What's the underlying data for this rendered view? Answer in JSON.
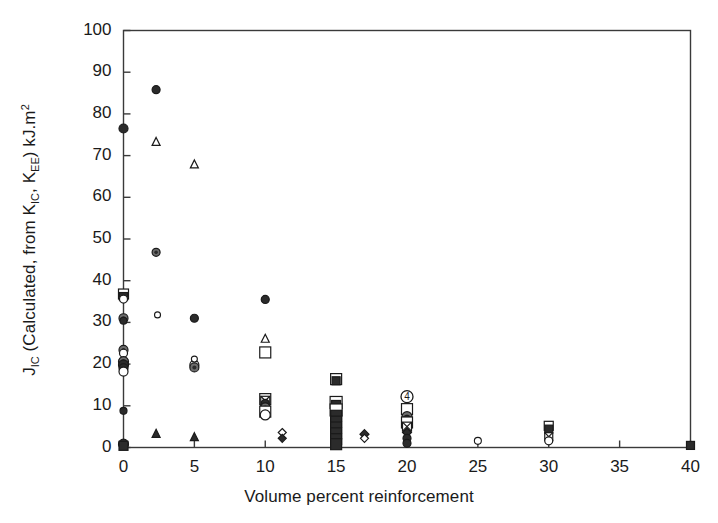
{
  "chart_data": {
    "type": "scatter",
    "title": "",
    "xlabel": "Volume percent reinforcement",
    "ylabel_parts": {
      "j": "J",
      "j_sub": "IC",
      "mid": " (Calculated, from K",
      "k1_sub": "IC",
      "mid2": ", K",
      "k2_sub": "EE",
      "tail": ") kJ.m",
      "tail_sup": "2"
    },
    "ylabel": "JIC (Calculated, from KIC, KEE) kJ.m2",
    "xlim": [
      0,
      40
    ],
    "ylim": [
      0,
      100
    ],
    "xticks": [
      0,
      5,
      10,
      15,
      20,
      25,
      30,
      35,
      40
    ],
    "yticks": [
      0,
      10,
      20,
      30,
      40,
      50,
      60,
      70,
      80,
      90,
      100
    ],
    "xtick_labels": [
      "0",
      "5",
      "10",
      "15",
      "20",
      "25",
      "30",
      "35",
      "40"
    ],
    "ytick_labels": [
      "0",
      "10",
      "20",
      "30",
      "40",
      "50",
      "60",
      "70",
      "80",
      "90",
      "100"
    ],
    "grid": false,
    "legend": "none",
    "frame": "full-box",
    "tick_direction": "in",
    "marker_colors": {
      "stroke": "#1a1a1a",
      "fill_solid": "#2b2b2b",
      "fill_open": "#ffffff",
      "fill_half": "#6d6d6d"
    },
    "points": [
      {
        "x": 0,
        "y": 76.5,
        "marker": "filled-circle",
        "size": 9
      },
      {
        "x": 2.3,
        "y": 85.8,
        "marker": "filled-circle",
        "size": 8
      },
      {
        "x": 2.3,
        "y": 73.4,
        "marker": "open-triangle",
        "size": 8
      },
      {
        "x": 5.0,
        "y": 68.0,
        "marker": "open-triangle",
        "size": 8
      },
      {
        "x": 2.3,
        "y": 46.8,
        "marker": "half-circle",
        "size": 8
      },
      {
        "x": 0,
        "y": 36.8,
        "marker": "open-square",
        "size": 10
      },
      {
        "x": 0,
        "y": 36.2,
        "marker": "filled-square",
        "size": 8
      },
      {
        "x": 0,
        "y": 35.6,
        "marker": "open-circle",
        "size": 8
      },
      {
        "x": 2.4,
        "y": 31.8,
        "marker": "small-open-circle",
        "size": 6
      },
      {
        "x": 5.0,
        "y": 31.0,
        "marker": "filled-circle",
        "size": 8
      },
      {
        "x": 0,
        "y": 31.0,
        "marker": "half-circle",
        "size": 9
      },
      {
        "x": 0,
        "y": 30.4,
        "marker": "filled-circle",
        "size": 7
      },
      {
        "x": 10.0,
        "y": 35.5,
        "marker": "filled-circle",
        "size": 8
      },
      {
        "x": 0,
        "y": 23.4,
        "marker": "half-circle",
        "size": 9
      },
      {
        "x": 0,
        "y": 22.6,
        "marker": "open-circle",
        "size": 8
      },
      {
        "x": 10.0,
        "y": 26.2,
        "marker": "open-triangle",
        "size": 8
      },
      {
        "x": 10.0,
        "y": 22.8,
        "marker": "open-square",
        "size": 11
      },
      {
        "x": 0,
        "y": 20.6,
        "marker": "half-circle",
        "size": 10
      },
      {
        "x": 0,
        "y": 19.8,
        "marker": "filled-circle",
        "size": 10
      },
      {
        "x": 0,
        "y": 19.0,
        "marker": "filled-circle",
        "size": 9
      },
      {
        "x": 0,
        "y": 18.2,
        "marker": "open-circle",
        "size": 9
      },
      {
        "x": 5.0,
        "y": 19.8,
        "marker": "open-circle",
        "size": 9
      },
      {
        "x": 5.0,
        "y": 19.2,
        "marker": "half-circle",
        "size": 9
      },
      {
        "x": 5.0,
        "y": 21.2,
        "marker": "small-open-circle",
        "size": 6
      },
      {
        "x": 15.0,
        "y": 16.4,
        "marker": "open-square",
        "size": 11
      },
      {
        "x": 15.0,
        "y": 16.0,
        "marker": "filled-square",
        "size": 8
      },
      {
        "x": 20.0,
        "y": 12.2,
        "marker": "circled-four",
        "size": 12
      },
      {
        "x": 10.0,
        "y": 11.6,
        "marker": "open-square",
        "size": 11
      },
      {
        "x": 10.0,
        "y": 11.2,
        "marker": "cross-square",
        "size": 9
      },
      {
        "x": 10.0,
        "y": 10.6,
        "marker": "filled-circle",
        "size": 8
      },
      {
        "x": 10.0,
        "y": 9.6,
        "marker": "half-circle",
        "size": 9
      },
      {
        "x": 10.0,
        "y": 8.6,
        "marker": "open-square",
        "size": 11
      },
      {
        "x": 10.0,
        "y": 7.8,
        "marker": "open-circle",
        "size": 10
      },
      {
        "x": 15.0,
        "y": 10.8,
        "marker": "open-square",
        "size": 12
      },
      {
        "x": 15.0,
        "y": 10.2,
        "marker": "filled-square",
        "size": 9
      },
      {
        "x": 15.0,
        "y": 9.0,
        "marker": "open-square",
        "size": 12
      },
      {
        "x": 15.0,
        "y": 7.6,
        "marker": "filled-square",
        "size": 11
      },
      {
        "x": 15.0,
        "y": 6.2,
        "marker": "filled-square",
        "size": 11
      },
      {
        "x": 15.0,
        "y": 4.8,
        "marker": "filled-square",
        "size": 11
      },
      {
        "x": 15.0,
        "y": 3.4,
        "marker": "filled-square",
        "size": 11
      },
      {
        "x": 15.0,
        "y": 2.0,
        "marker": "filled-square",
        "size": 11
      },
      {
        "x": 15.0,
        "y": 0.8,
        "marker": "filled-square",
        "size": 11
      },
      {
        "x": 20.0,
        "y": 9.2,
        "marker": "open-square",
        "size": 11
      },
      {
        "x": 20.0,
        "y": 7.4,
        "marker": "half-circle",
        "size": 10
      },
      {
        "x": 20.0,
        "y": 6.6,
        "marker": "filled-circle",
        "size": 9
      },
      {
        "x": 20.0,
        "y": 6.0,
        "marker": "open-square",
        "size": 11
      },
      {
        "x": 20.0,
        "y": 5.0,
        "marker": "cross-square",
        "size": 9
      },
      {
        "x": 20.0,
        "y": 3.6,
        "marker": "filled-diamond",
        "size": 9
      },
      {
        "x": 20.0,
        "y": 2.2,
        "marker": "filled-circle",
        "size": 8
      },
      {
        "x": 20.0,
        "y": 1.0,
        "marker": "filled-circle",
        "size": 8
      },
      {
        "x": 11.2,
        "y": 3.6,
        "marker": "open-diamond",
        "size": 8
      },
      {
        "x": 11.2,
        "y": 2.2,
        "marker": "filled-diamond",
        "size": 8
      },
      {
        "x": 17.0,
        "y": 3.2,
        "marker": "filled-diamond",
        "size": 9
      },
      {
        "x": 17.0,
        "y": 2.2,
        "marker": "open-diamond",
        "size": 8
      },
      {
        "x": 2.3,
        "y": 3.4,
        "marker": "filled-triangle",
        "size": 8
      },
      {
        "x": 5.0,
        "y": 2.6,
        "marker": "filled-triangle",
        "size": 8
      },
      {
        "x": 0,
        "y": 8.8,
        "marker": "filled-circle",
        "size": 7
      },
      {
        "x": 0,
        "y": 0.8,
        "marker": "filled-circle",
        "size": 10
      },
      {
        "x": 0,
        "y": 0.4,
        "marker": "filled-square",
        "size": 9
      },
      {
        "x": 25.0,
        "y": 1.6,
        "marker": "small-open-circle",
        "size": 7
      },
      {
        "x": 30.0,
        "y": 5.2,
        "marker": "open-square",
        "size": 9
      },
      {
        "x": 30.0,
        "y": 4.4,
        "marker": "filled-square",
        "size": 8
      },
      {
        "x": 30.0,
        "y": 2.6,
        "marker": "cross-square",
        "size": 8
      },
      {
        "x": 30.0,
        "y": 1.6,
        "marker": "open-circle",
        "size": 8
      },
      {
        "x": 40.0,
        "y": 0.5,
        "marker": "filled-square",
        "size": 8
      }
    ]
  }
}
